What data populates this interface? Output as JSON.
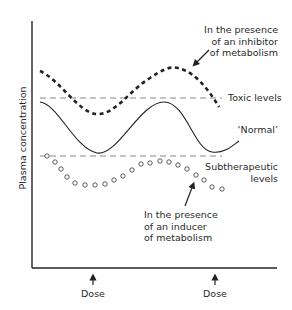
{
  "axes": {
    "y_label": "Plasma concentration",
    "x_tick_labels": [
      "Dose",
      "Dose"
    ]
  },
  "reference_lines": {
    "toxic_label": "Toxic levels",
    "subtherapeutic_label_line1": "Subtherapeutic",
    "subtherapeutic_label_line2": "levels"
  },
  "curves": {
    "normal_label": "‘Normal’",
    "inhibitor_label_line1": "In the presence",
    "inhibitor_label_line2": "of an inhibitor",
    "inhibitor_label_line3": "of metabolism",
    "inducer_label_line1": "In the presence",
    "inducer_label_line2": "of an inducer",
    "inducer_label_line3": "of metabolism"
  },
  "colors": {
    "line": "#222222",
    "reference": "#888888"
  }
}
